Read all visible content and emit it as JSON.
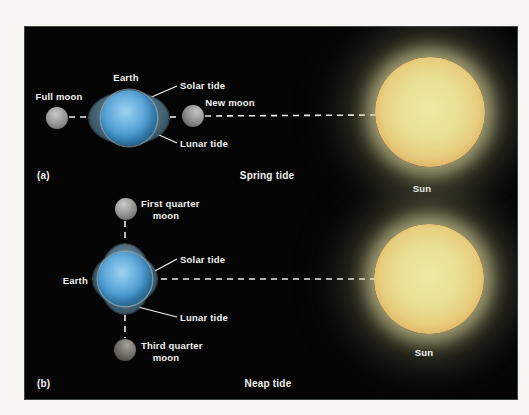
{
  "panel_a": {
    "caption": "(a)",
    "title": "Spring tide",
    "earth_label": "Earth",
    "full_moon_label": "Full moon",
    "new_moon_label": "New moon",
    "solar_tide_label": "Solar tide",
    "lunar_tide_label": "Lunar tide",
    "sun_label": "Sun"
  },
  "panel_b": {
    "caption": "(b)",
    "title": "Neap tide",
    "earth_label": "Earth",
    "first_quarter_moon_line1": "First quarter",
    "first_quarter_moon_line2": "moon",
    "third_quarter_moon_line1": "Third quarter",
    "third_quarter_moon_line2": "moon",
    "solar_tide_label": "Solar tide",
    "lunar_tide_label": "Lunar tide",
    "sun_label": "Sun"
  },
  "colors": {
    "panel_background": "#050505",
    "page_background": "#f6f5f1",
    "earth_blue": "#4496cd",
    "tidal_bulge_slate": "#3a5968",
    "sun_core_yellow": "#e9e093",
    "sun_rim_orange": "#d9a458",
    "moon_gray": "#969696",
    "label_text": "#f2f2f0",
    "dashed_line": "#e9e9e6"
  }
}
